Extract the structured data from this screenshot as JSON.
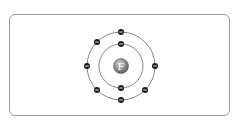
{
  "diagram": {
    "type": "bohr-model",
    "element": "Fluorine",
    "nucleus": {
      "label": "F"
    },
    "shells": [
      {
        "name": "inner",
        "electrons": 2
      },
      {
        "name": "outer",
        "electrons": 7
      }
    ],
    "electron_symbol": "−",
    "colors": {
      "frame": "#9a9a9a",
      "orbit": "#777777",
      "electron": "#1a1a1a",
      "nucleus": "#8a8a8a",
      "nucleus_label": "#ffffff"
    }
  }
}
